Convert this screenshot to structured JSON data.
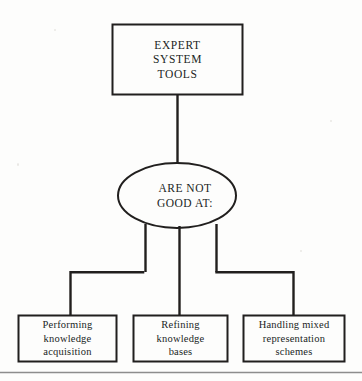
{
  "diagram": {
    "type": "flowchart",
    "title_node": {
      "shape": "rectangle",
      "lines": [
        "EXPERT",
        "SYSTEM",
        "TOOLS"
      ]
    },
    "condition_node": {
      "shape": "ellipse",
      "lines": [
        "ARE NOT",
        "GOOD AT:"
      ]
    },
    "leaf_nodes": [
      {
        "shape": "rectangle",
        "lines": [
          "Performing",
          "knowledge",
          "acquisition"
        ]
      },
      {
        "shape": "rectangle",
        "lines": [
          "Refining",
          "knowledge",
          "bases"
        ]
      },
      {
        "shape": "rectangle",
        "lines": [
          "Handling mixed",
          "representation",
          "schemes"
        ]
      }
    ]
  },
  "colors": {
    "stroke": "#211f1e",
    "text": "#211f1e",
    "background": "#fdfdfc",
    "footer_rule": "#8d8d8d"
  }
}
